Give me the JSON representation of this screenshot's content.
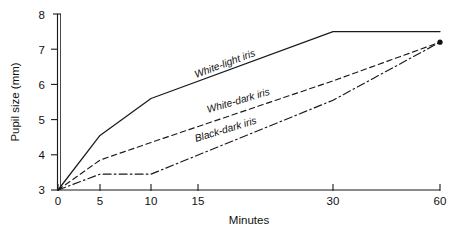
{
  "chart_data": {
    "type": "line",
    "title": "",
    "xlabel": "Minutes",
    "ylabel": "Pupil size (mm)",
    "x_ticks": [
      0,
      5,
      10,
      15,
      30,
      60
    ],
    "x_tick_labels": [
      "0",
      "5",
      "10",
      "15",
      "30",
      "60"
    ],
    "x_scale": "non-linear-compressed",
    "y_ticks": [
      3,
      4,
      5,
      6,
      7,
      8
    ],
    "y_tick_labels": [
      "3",
      "4",
      "5",
      "6",
      "7",
      "8"
    ],
    "ylim": [
      3,
      8
    ],
    "grid": false,
    "legend": "inline-curve-labels",
    "series": [
      {
        "name": "White-light iris",
        "style": "solid",
        "label_text": "White-light iris",
        "x": [
          0,
          5,
          10,
          30,
          60
        ],
        "values": [
          3.0,
          4.55,
          5.6,
          7.5,
          7.5
        ]
      },
      {
        "name": "White-dark iris",
        "style": "dashed",
        "label_text": "White-dark iris",
        "x": [
          0,
          5,
          10,
          30,
          60
        ],
        "values": [
          3.0,
          3.85,
          4.35,
          6.1,
          7.2
        ]
      },
      {
        "name": "Black-dark iris",
        "style": "dash-dot",
        "label_text": "Black-dark iris",
        "x": [
          0,
          5,
          10,
          30,
          60
        ],
        "values": [
          3.0,
          3.45,
          3.45,
          5.55,
          7.2
        ]
      }
    ]
  },
  "labels": {
    "white_light": "White-light iris",
    "white_dark": "White-dark iris",
    "black_dark": "Black-dark iris",
    "x_axis": "Minutes",
    "y_axis": "Pupil size (mm)",
    "y3": "3",
    "y4": "4",
    "y5": "5",
    "y6": "6",
    "y7": "7",
    "y8": "8",
    "x0": "0",
    "x5": "5",
    "x10": "10",
    "x15": "15",
    "x30": "30",
    "x60": "60"
  },
  "colors": {
    "ink": "#1a1a1a",
    "background": "#ffffff"
  }
}
